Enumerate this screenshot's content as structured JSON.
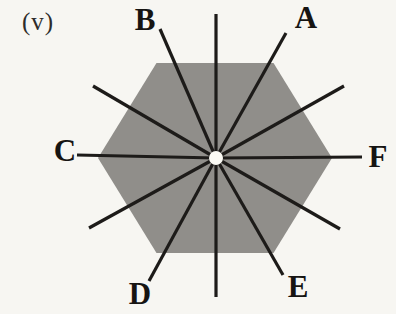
{
  "figure": {
    "index_label": "(v)",
    "shape": "hexagon",
    "axis_labels": [
      "A",
      "B",
      "C",
      "D",
      "E",
      "F"
    ],
    "labels": {
      "A": "A",
      "B": "B",
      "C": "C",
      "D": "D",
      "E": "E",
      "F": "F"
    }
  },
  "colors": {
    "background": "#f7f6f2",
    "hexagon_fill": "#908e8a",
    "line": "#1d1b19",
    "center_dot": "#fbfaf4",
    "label_text": "#161412",
    "index_label_text": "#2e2c2a"
  }
}
